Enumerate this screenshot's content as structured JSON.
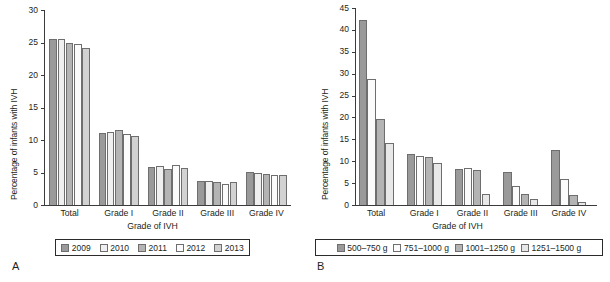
{
  "figure": {
    "panel_a_letter": "A",
    "panel_b_letter": "B"
  },
  "chart_data": [
    {
      "panel": "A",
      "type": "bar",
      "title": "",
      "xlabel": "Grade of IVH",
      "ylabel": "Percentage of infants with IVH",
      "categories": [
        "Total",
        "Grade I",
        "Grade II",
        "Grade III",
        "Grade IV"
      ],
      "ylim": [
        0,
        30
      ],
      "yticks": [
        0,
        5,
        10,
        15,
        20,
        25,
        30
      ],
      "grid": false,
      "legend_position": "bottom",
      "series": [
        {
          "name": "2009",
          "color": "#9a9a9a",
          "values": [
            25.6,
            11.1,
            5.9,
            3.7,
            5.1
          ]
        },
        {
          "name": "2010",
          "color": "#efefef",
          "values": [
            25.6,
            11.2,
            6.0,
            3.7,
            5.0
          ]
        },
        {
          "name": "2011",
          "color": "#b4b4b4",
          "values": [
            24.9,
            11.5,
            5.6,
            3.5,
            4.7
          ]
        },
        {
          "name": "2012",
          "color": "#fbfbfb",
          "values": [
            24.8,
            10.9,
            6.1,
            3.3,
            4.6
          ]
        },
        {
          "name": "2013",
          "color": "#d2d2d2",
          "values": [
            24.1,
            10.6,
            5.7,
            3.6,
            4.6
          ]
        }
      ]
    },
    {
      "panel": "B",
      "type": "bar",
      "title": "",
      "xlabel": "Grade of IVH",
      "ylabel": "Percentage of infants with IVH",
      "categories": [
        "Total",
        "Grade I",
        "Grade II",
        "Grade III",
        "Grade IV"
      ],
      "ylim": [
        0,
        45
      ],
      "yticks": [
        0,
        5,
        10,
        15,
        20,
        25,
        30,
        35,
        40,
        45
      ],
      "grid": false,
      "legend_position": "bottom",
      "series": [
        {
          "name": "500–750 g",
          "color": "#9a9a9a",
          "values": [
            42.3,
            11.6,
            8.3,
            7.6,
            12.5
          ]
        },
        {
          "name": "751–1000 g",
          "color": "#fbfbfb",
          "values": [
            28.8,
            11.2,
            8.4,
            4.4,
            6.0
          ]
        },
        {
          "name": "1001–1250 g",
          "color": "#b4b4b4",
          "values": [
            19.7,
            11.0,
            7.9,
            2.6,
            2.2
          ]
        },
        {
          "name": "1251–1500 g",
          "color": "#e8e8e8",
          "values": [
            14.1,
            9.5,
            2.5,
            1.3,
            0.7
          ]
        }
      ]
    }
  ]
}
